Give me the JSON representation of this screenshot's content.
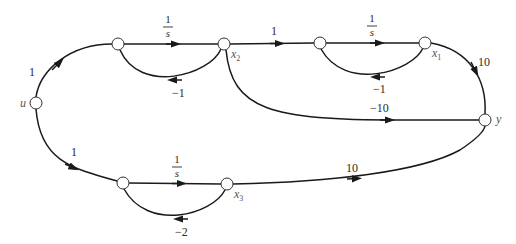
{
  "diagram": {
    "type": "signal-flow-graph",
    "nodes": {
      "u": {
        "label": "u",
        "x": 36,
        "y": 103
      },
      "n1": {
        "label": "",
        "x": 118,
        "y": 44
      },
      "x2": {
        "label": "x",
        "sub": "2",
        "x": 224,
        "y": 44
      },
      "n3": {
        "label": "",
        "x": 320,
        "y": 43
      },
      "x1": {
        "label": "x",
        "sub": "1",
        "x": 425,
        "y": 43
      },
      "y": {
        "label": "y",
        "x": 485,
        "y": 120
      },
      "n5": {
        "label": "",
        "x": 123,
        "y": 183
      },
      "x3": {
        "label": "x",
        "sub": "3",
        "x": 227,
        "y": 184
      }
    },
    "edges": [
      {
        "from": "u",
        "to": "n1",
        "gain": "1"
      },
      {
        "from": "n1",
        "to": "x2",
        "gain_num": "1",
        "gain_den": "s"
      },
      {
        "from": "x2",
        "to": "n1",
        "gain": "−1"
      },
      {
        "from": "x2",
        "to": "n3",
        "gain": "1"
      },
      {
        "from": "n3",
        "to": "x1",
        "gain_num": "1",
        "gain_den": "s"
      },
      {
        "from": "x1",
        "to": "n3",
        "gain": "−1"
      },
      {
        "from": "x1",
        "to": "y",
        "gain": "10"
      },
      {
        "from": "x2",
        "to": "y",
        "gain": "−10"
      },
      {
        "from": "u",
        "to": "n5",
        "gain": "1"
      },
      {
        "from": "n5",
        "to": "x3",
        "gain_num": "1",
        "gain_den": "s"
      },
      {
        "from": "x3",
        "to": "n5",
        "gain": "−2"
      },
      {
        "from": "x3",
        "to": "y",
        "gain": "10"
      }
    ]
  }
}
